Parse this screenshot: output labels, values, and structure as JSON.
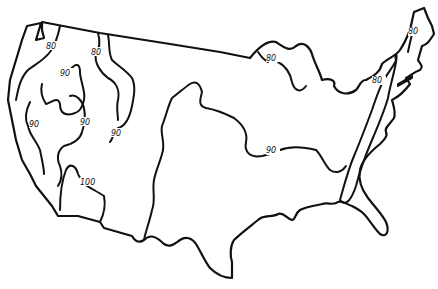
{
  "map": {
    "subject": "Contiguous United States isotherm map",
    "isotherm_labels": [
      {
        "id": "nw-80",
        "value": "80",
        "x": 52,
        "y": 48
      },
      {
        "id": "mt-80",
        "value": "80",
        "x": 96,
        "y": 54
      },
      {
        "id": "ore-90",
        "value": "90",
        "x": 66,
        "y": 75
      },
      {
        "id": "ca-90",
        "value": "90",
        "x": 35,
        "y": 126
      },
      {
        "id": "nv-90",
        "value": "90",
        "x": 86,
        "y": 124
      },
      {
        "id": "az-90",
        "value": "90",
        "x": 117,
        "y": 135
      },
      {
        "id": "az-100",
        "value": "100",
        "x": 87,
        "y": 184
      },
      {
        "id": "lakes-80",
        "value": "80",
        "x": 272,
        "y": 60
      },
      {
        "id": "central-90",
        "value": "90",
        "x": 272,
        "y": 152
      },
      {
        "id": "app-80",
        "value": "80",
        "x": 378,
        "y": 82
      },
      {
        "id": "ne-80",
        "value": "80",
        "x": 414,
        "y": 33
      }
    ]
  }
}
